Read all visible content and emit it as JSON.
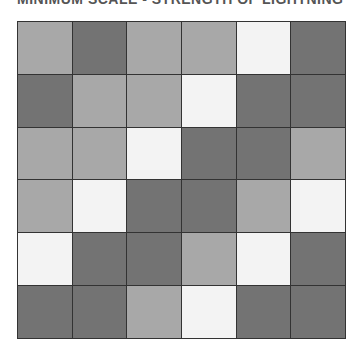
{
  "title": "MINIMUM SCALE - STRENGTH OF LIGHTNING",
  "palette": {
    "L": "#a8a8a8",
    "D": "#737373",
    "W": "#f3f3f3"
  },
  "grid": {
    "rows": 6,
    "cols": 6,
    "cells": [
      [
        "L",
        "D",
        "L",
        "L",
        "W",
        "D"
      ],
      [
        "D",
        "L",
        "L",
        "W",
        "D",
        "D"
      ],
      [
        "L",
        "L",
        "W",
        "D",
        "D",
        "L"
      ],
      [
        "L",
        "W",
        "D",
        "D",
        "L",
        "W"
      ],
      [
        "W",
        "D",
        "D",
        "L",
        "W",
        "D"
      ],
      [
        "D",
        "D",
        "L",
        "W",
        "D",
        "D"
      ]
    ]
  }
}
